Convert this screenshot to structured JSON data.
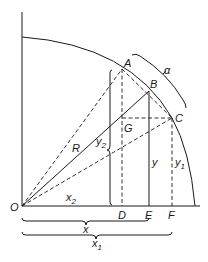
{
  "diagram": {
    "points": {
      "O": "O",
      "A": "A",
      "B": "B",
      "C": "C",
      "D": "D",
      "E": "E",
      "F": "F",
      "G": "G"
    },
    "labels": {
      "radius": "R",
      "angle": "α",
      "y": "y",
      "y1_base": "y",
      "y1_sub": "1",
      "y2_base": "y",
      "y2_sub": "2",
      "x": "x",
      "x1_base": "x",
      "x1_sub": "1",
      "x2_base": "x",
      "x2_sub": "2"
    },
    "colors": {
      "line": "#1a1a1a",
      "background": "#ffffff"
    }
  }
}
